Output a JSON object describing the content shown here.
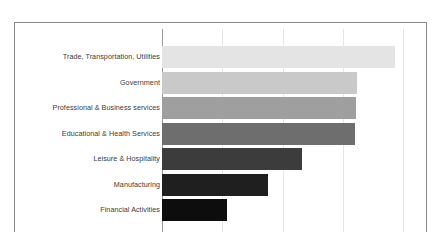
{
  "chart_data": {
    "type": "bar",
    "orientation": "horizontal",
    "title": "",
    "subtitle": "",
    "xlabel": "",
    "ylabel": "",
    "categories": [
      "Trade, Transportation, Utilities",
      "Government",
      "Professional & Business services",
      "Educational & Health Services",
      "Leisure & Hospitality",
      "Manufacturing",
      "Financial Activities"
    ],
    "values": [
      3.86,
      3.23,
      3.22,
      3.2,
      2.32,
      1.76,
      1.08
    ],
    "bar_colors": [
      "#e4e4e4",
      "#c9c9c9",
      "#9f9f9f",
      "#6e6e6e",
      "#3c3c3c",
      "#1f1f1f",
      "#0d0d0d"
    ],
    "xlim": [
      0,
      4.4
    ],
    "gridlines_at": [
      1,
      2,
      3,
      4
    ],
    "grid": true,
    "legend": "none",
    "tick_labels_visible": false,
    "axis_color": "#9a9a9a",
    "grid_color": "#e6e6e6",
    "frame_color": "#8a8a8a",
    "label_color": "#3b3b3b",
    "background": "#ffffff",
    "note": "Horizontal bar chart, category labels right-aligned at the value axis; x tick labels are cropped off the bottom of the screenshot."
  }
}
